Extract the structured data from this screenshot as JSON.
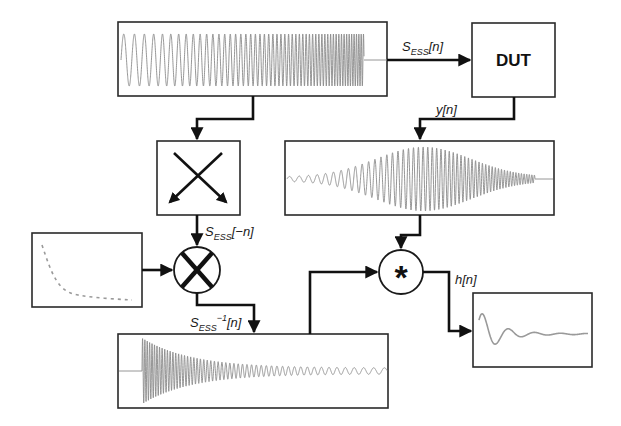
{
  "diagram": {
    "blocks": {
      "sweep_signal": {
        "label": ""
      },
      "dut": {
        "label": "DUT"
      },
      "time_reversal": {
        "label": ""
      },
      "envelope": {
        "label": ""
      },
      "multiplier": {
        "symbol": "×"
      },
      "recorded_output": {
        "label": ""
      },
      "inverse_filter": {
        "label": ""
      },
      "convolution": {
        "symbol": "*"
      },
      "impulse_response": {
        "label": ""
      }
    },
    "signals": {
      "sweep": {
        "base": "S",
        "sub": "ESS",
        "arg": "[n]"
      },
      "output": {
        "text": "y[n]"
      },
      "reversed": {
        "base": "S",
        "sub": "ESS",
        "arg": "[−n]"
      },
      "inverse": {
        "base": "S",
        "sub": "ESS",
        "sup": "−1",
        "arg": "[n]"
      },
      "impulse": {
        "text": "h[n]"
      }
    },
    "colors": {
      "line": "#111111",
      "waveform": "#8a8a8a",
      "box_border": "#2a2a2a",
      "background": "#ffffff"
    }
  }
}
